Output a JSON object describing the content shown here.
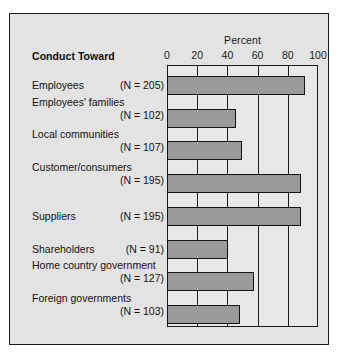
{
  "figure": {
    "heading": "Conduct Toward",
    "axis_title": "Percent",
    "panel_color": "#e3e3e3",
    "plot_background": "#e8e8e8",
    "bar_fill": "#9a9a9a",
    "bar_border": "#121212",
    "frame_color": "#1a1a1a"
  },
  "chart_data": {
    "type": "bar",
    "orientation": "horizontal",
    "title": "",
    "xlabel": "Percent",
    "ylabel": "Conduct Toward",
    "xlim": [
      0,
      100
    ],
    "ticks": [
      0,
      20,
      40,
      60,
      80,
      100
    ],
    "tick_labels": [
      "0",
      "20",
      "40",
      "60",
      "80",
      "100"
    ],
    "grid": true,
    "legend": null,
    "categories": [
      "Employees",
      "Employees' families",
      "Local communities",
      "Customer/consumers",
      "Suppliers",
      "Shareholders",
      "Home country government",
      "Foreign governments"
    ],
    "values": [
      91,
      45,
      49,
      88,
      88,
      40,
      57,
      48
    ],
    "sample_sizes": [
      "(N = 205)",
      "(N = 102)",
      "(N = 107)",
      "(N = 195)",
      "(N = 195)",
      "(N = 91)",
      "(N = 127)",
      "(N = 103)"
    ],
    "rows": [
      {
        "label": "Employees",
        "n": "(N = 205)",
        "value": 91,
        "layout": "one-line"
      },
      {
        "label": "Employees' families",
        "n": "(N = 102)",
        "value": 45,
        "layout": "two-line"
      },
      {
        "label": "Local communities",
        "n": "(N = 107)",
        "value": 49,
        "layout": "two-line"
      },
      {
        "label": "Customer/consumers",
        "n": "(N = 195)",
        "value": 88,
        "layout": "two-line"
      },
      {
        "label": "Suppliers",
        "n": "(N = 195)",
        "value": 88,
        "layout": "one-line"
      },
      {
        "label": "Shareholders",
        "n": "(N = 91)",
        "value": 40,
        "layout": "one-line"
      },
      {
        "label": "Home country government",
        "n": "(N = 127)",
        "value": 57,
        "layout": "two-line"
      },
      {
        "label": "Foreign governments",
        "n": "(N = 103)",
        "value": 48,
        "layout": "two-line"
      }
    ]
  }
}
